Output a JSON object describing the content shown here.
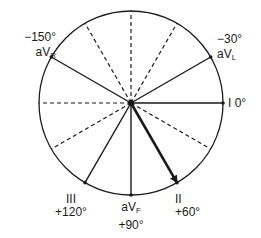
{
  "diagram": {
    "center": {
      "x": 131,
      "y": 103
    },
    "radius": 92,
    "colors": {
      "line": "#1a1a1a",
      "background": "#ffffff"
    },
    "solid_axes": [
      {
        "angle": 0,
        "lead": "I"
      },
      {
        "angle": -30,
        "lead": "aVL"
      },
      {
        "angle": -150,
        "lead": "aVR"
      },
      {
        "angle": 60,
        "lead": "II",
        "arrow": true,
        "bold": true
      },
      {
        "angle": 90,
        "lead": "aVF"
      },
      {
        "angle": 120,
        "lead": "III"
      }
    ],
    "dashed_axes": [
      180,
      -60,
      -90,
      -120,
      30,
      150
    ]
  },
  "labels": {
    "lead_I": {
      "lead": "I",
      "degrees": "0°"
    },
    "lead_aVL": {
      "degrees": "−30°",
      "lead_main": "aV",
      "lead_sub": "L"
    },
    "lead_aVR": {
      "degrees": "−150°",
      "lead_main": "aV",
      "lead_sub": "R"
    },
    "lead_II": {
      "lead": "II",
      "degrees": "+60°"
    },
    "lead_aVF": {
      "lead_main": "aV",
      "lead_sub": "F",
      "degrees": "+90°"
    },
    "lead_III": {
      "lead": "III",
      "degrees": "+120°"
    }
  }
}
